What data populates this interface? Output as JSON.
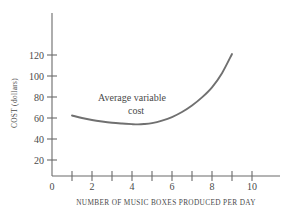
{
  "chart_data": {
    "type": "line",
    "title": "",
    "xlabel": "NUMBER OF MUSIC BOXES PRODUCED PER DAY",
    "ylabel": "COST (dollars)",
    "xlim": [
      0,
      11
    ],
    "ylim": [
      0,
      132
    ],
    "grid": false,
    "legend": null,
    "x_ticks": [
      1,
      2,
      3,
      4,
      5,
      6,
      7,
      8,
      9,
      10
    ],
    "x_tick_labels": [
      "0",
      "2",
      "4",
      "6",
      "8",
      "10"
    ],
    "x_tick_label_values": [
      0,
      2,
      4,
      6,
      8,
      10
    ],
    "y_ticks": [
      20,
      40,
      60,
      80,
      100,
      120
    ],
    "y_tick_labels": [
      "120",
      "100",
      "80",
      "60",
      "40",
      "20"
    ],
    "series": [
      {
        "name": "Average variable cost",
        "x": [
          1.0,
          1.5,
          2.0,
          2.5,
          3.0,
          3.5,
          4.0,
          4.3,
          4.6,
          5.0,
          5.5,
          6.0,
          6.5,
          7.0,
          7.5,
          8.0,
          8.5,
          9.0
        ],
        "y": [
          60.0,
          57.5,
          55.5,
          54.0,
          52.8,
          52.0,
          51.4,
          51.2,
          51.5,
          52.5,
          55.0,
          58.5,
          63.5,
          70.0,
          78.0,
          88.0,
          102.0,
          121.0
        ]
      }
    ],
    "annotations": [
      {
        "text_line1": "Average variable",
        "text_line2": "cost",
        "x": 4.0,
        "y": 78
      }
    ]
  },
  "axis": {
    "x_title": "NUMBER OF MUSIC BOXES PRODUCED PER DAY",
    "y_title": "COST (dollars)"
  },
  "labels": {
    "y": [
      "120",
      "100",
      "80",
      "60",
      "40",
      "20"
    ],
    "x": [
      "0",
      "2",
      "4",
      "6",
      "8",
      "10"
    ]
  },
  "annotation": {
    "line1": "Average variable",
    "line2": "cost"
  },
  "colors": {
    "curve": "#707070",
    "axis": "#6b6b6b",
    "text": "#4a4a4a",
    "background": "#ffffff"
  }
}
